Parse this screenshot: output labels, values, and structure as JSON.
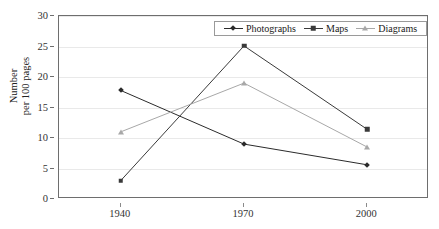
{
  "figure": {
    "clipped_top_text": "",
    "background_color": "#ffffff",
    "frame_color": "#6e6e6e"
  },
  "legend": {
    "position": "top-center-inside",
    "entries": [
      {
        "label": "Photographs",
        "color": "#2b2b2b",
        "marker": "diamond"
      },
      {
        "label": "Maps",
        "color": "#3a3a3a",
        "marker": "square"
      },
      {
        "label": "Diagrams",
        "color": "#a8a8a8",
        "marker": "triangle"
      }
    ]
  },
  "axes": {
    "y_title_line1": "Number",
    "y_title_line2": "per 100 pages",
    "y_ticks": [
      "0",
      "5",
      "10",
      "15",
      "20",
      "25",
      "30"
    ],
    "x_ticks": [
      "1940",
      "1970",
      "2000"
    ]
  },
  "chart_data": {
    "type": "line",
    "title": "",
    "xlabel": "",
    "ylabel": "Number per 100 pages",
    "categories": [
      "1940",
      "1970",
      "2000"
    ],
    "x": [
      1940,
      1970,
      2000
    ],
    "ylim": [
      0,
      30
    ],
    "ytick_step": 5,
    "grid": true,
    "legend_position": "top-center",
    "series": [
      {
        "name": "Photographs",
        "marker": "diamond",
        "color": "#2b2b2b",
        "values": [
          17.8,
          9.0,
          5.6
        ]
      },
      {
        "name": "Maps",
        "marker": "square",
        "color": "#3a3a3a",
        "values": [
          3.0,
          25.1,
          11.4
        ]
      },
      {
        "name": "Diagrams",
        "marker": "triangle",
        "color": "#a8a8a8",
        "values": [
          11.0,
          19.0,
          8.5
        ]
      }
    ]
  }
}
